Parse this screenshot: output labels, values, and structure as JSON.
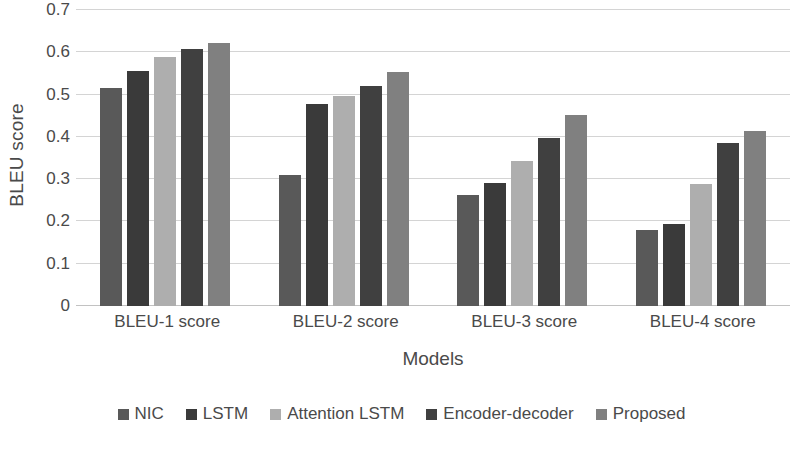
{
  "chart_data": {
    "type": "bar",
    "title": "",
    "xlabel": "Models",
    "ylabel": "BLEU score",
    "categories": [
      "BLEU-1 score",
      "BLEU-2 score",
      "BLEU-3 score",
      "BLEU-4 score"
    ],
    "series": [
      {
        "name": "NIC",
        "color": "#595959",
        "values": [
          0.515,
          0.31,
          0.262,
          0.18
        ]
      },
      {
        "name": "LSTM",
        "color": "#3a3a3a",
        "values": [
          0.555,
          0.478,
          0.292,
          0.194
        ]
      },
      {
        "name": "Attention LSTM",
        "color": "#aeaeae",
        "values": [
          0.588,
          0.497,
          0.342,
          0.288
        ]
      },
      {
        "name": "Encoder-decoder",
        "color": "#404040",
        "values": [
          0.608,
          0.52,
          0.397,
          0.385
        ]
      },
      {
        "name": "Proposed",
        "color": "#808080",
        "values": [
          0.623,
          0.553,
          0.452,
          0.415
        ]
      }
    ],
    "ylim": [
      0,
      0.7
    ],
    "ytick_values": [
      0,
      0.1,
      0.2,
      0.3,
      0.4,
      0.5,
      0.6,
      0.7
    ],
    "ytick_labels": [
      "0",
      "0.1",
      "0.2",
      "0.3",
      "0.4",
      "0.5",
      "0.6",
      "0.7"
    ],
    "grid": true,
    "legend_position": "bottom",
    "orientation": "vertical"
  }
}
